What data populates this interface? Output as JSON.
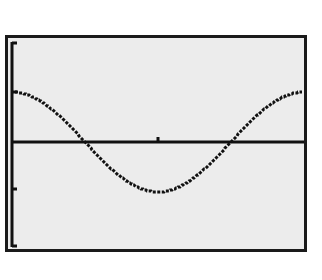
{
  "screen": {
    "background": "#ececec",
    "border_color": "#1a1a1a",
    "ink_color": "#111111"
  },
  "chart_data": {
    "type": "line",
    "title": "",
    "xlabel": "",
    "ylabel": "",
    "function": "y = cos(x)",
    "xlim": [
      0,
      6.2832
    ],
    "ylim": [
      -2,
      2
    ],
    "x_ticks": [
      3.1416
    ],
    "y_ticks": [
      2,
      1,
      -1,
      -2
    ],
    "grid": false,
    "legend": null,
    "series": [
      {
        "name": "cos(x)",
        "x": [
          0,
          0.785,
          1.571,
          2.356,
          3.142,
          3.927,
          4.712,
          5.498,
          6.283
        ],
        "values": [
          1,
          0.707,
          0,
          -0.707,
          -1,
          -0.707,
          0,
          0.707,
          1
        ]
      }
    ]
  }
}
